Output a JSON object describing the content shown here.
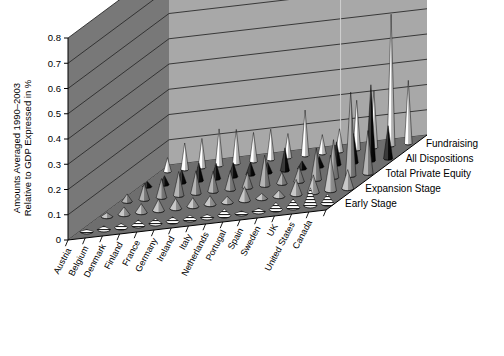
{
  "chart_data": {
    "type": "bar",
    "subtype": "3d-cone-surface",
    "title": "",
    "ylabel_line1": "Amounts Averaged 1990–2003",
    "ylabel_line2": "Relative to GDP Expressed in %",
    "xlabel": "",
    "zlabel": "",
    "ylim": [
      0,
      0.8
    ],
    "ytick_labels": [
      "0",
      "0.1",
      "0.2",
      "0.3",
      "0.4",
      "0.5",
      "0.6",
      "0.7",
      "0.8"
    ],
    "ytick_values": [
      0,
      0.1,
      0.2,
      0.3,
      0.4,
      0.5,
      0.6,
      0.7,
      0.8
    ],
    "grid": true,
    "legend_position": "right-floor-edge",
    "categories": [
      "Austria",
      "Belgium",
      "Denmark",
      "Finland",
      "France",
      "Germany",
      "Ireland",
      "Italy",
      "Netherlands",
      "Portugal",
      "Spain",
      "Sweden",
      "UK",
      "United States",
      "Canada"
    ],
    "series": [
      {
        "name": "Fundraising",
        "color": "#f2f2f2",
        "values": [
          0.055,
          0.105,
          0.115,
          0.145,
          0.135,
          0.115,
          0.12,
          0.095,
          0.18,
          0.075,
          0.09,
          0.195,
          0.225,
          0.52,
          0.25
        ]
      },
      {
        "name": "All Dispositions",
        "color": "#1a1a1a",
        "values": [
          0.02,
          0.035,
          0.05,
          0.07,
          0.06,
          0.055,
          0.05,
          0.04,
          0.09,
          0.03,
          0.04,
          0.09,
          0.115,
          0.3,
          0.13
        ]
      },
      {
        "name": "Total Private Equity",
        "color": "#8c8c8c",
        "values": [
          0.03,
          0.065,
          0.075,
          0.095,
          0.09,
          0.08,
          0.075,
          0.06,
          0.12,
          0.045,
          0.06,
          0.125,
          0.15,
          0.33,
          0.17
        ]
      },
      {
        "name": "Expansion Stage",
        "color": "#a6a6a6",
        "values": [
          0.015,
          0.03,
          0.035,
          0.045,
          0.04,
          0.035,
          0.035,
          0.025,
          0.055,
          0.02,
          0.025,
          0.06,
          0.07,
          0.14,
          0.075
        ]
      },
      {
        "name": "Early Stage",
        "color": "#ffffff",
        "hatch": "horizontal-stripes",
        "values": [
          0.008,
          0.014,
          0.016,
          0.022,
          0.02,
          0.018,
          0.017,
          0.012,
          0.026,
          0.01,
          0.013,
          0.028,
          0.034,
          0.07,
          0.038
        ]
      }
    ]
  },
  "axes": {
    "y_title_line1": "Amounts Averaged 1990–2003",
    "y_title_line2": "Relative to GDP Expressed in %",
    "y_ticks": [
      "0.8",
      "0.7",
      "0.6",
      "0.5",
      "0.4",
      "0.3",
      "0.2",
      "0.1",
      "0"
    ]
  },
  "categories": [
    "Austria",
    "Belgium",
    "Denmark",
    "Finland",
    "France",
    "Germany",
    "Ireland",
    "Italy",
    "Netherlands",
    "Portugal",
    "Spain",
    "Sweden",
    "UK",
    "United States",
    "Canada"
  ],
  "series_labels": [
    "Fundraising",
    "All Dispositions",
    "Total Private Equity",
    "Expansion Stage",
    "Early Stage"
  ],
  "colors": {
    "back_wall": "#a8a8a8",
    "left_wall": "#787878",
    "floor": "#6e6e6e",
    "gridline": "#2b2b2b",
    "fundraising": "#f2f2f2",
    "all_dispositions": "#1a1a1a",
    "total_private_equity": "#8c8c8c",
    "expansion_stage": "#a6a6a6",
    "early_stage": "#ffffff",
    "outline": "#000000",
    "background": "#ffffff"
  }
}
